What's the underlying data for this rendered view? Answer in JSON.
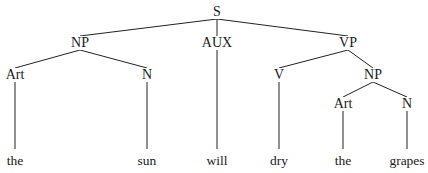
{
  "diagram": {
    "type": "syntactic-parse-tree",
    "sentence": "the sun will dry the grapes",
    "nodes": [
      {
        "id": "S",
        "label": "S",
        "x": 217,
        "y": 12
      },
      {
        "id": "NP1",
        "label": "NP",
        "x": 80,
        "y": 43
      },
      {
        "id": "AUX",
        "label": "AUX",
        "x": 217,
        "y": 43
      },
      {
        "id": "VP",
        "label": "VP",
        "x": 348,
        "y": 43
      },
      {
        "id": "ART1",
        "label": "Art",
        "x": 15,
        "y": 75
      },
      {
        "id": "N1",
        "label": "N",
        "x": 147,
        "y": 75
      },
      {
        "id": "V",
        "label": "V",
        "x": 279,
        "y": 75
      },
      {
        "id": "NP2",
        "label": "NP",
        "x": 373,
        "y": 75
      },
      {
        "id": "ART2",
        "label": "Art",
        "x": 343,
        "y": 104
      },
      {
        "id": "N2",
        "label": "N",
        "x": 407,
        "y": 104
      }
    ],
    "leaves": [
      {
        "id": "W1",
        "label": "the",
        "x": 15,
        "y": 161
      },
      {
        "id": "W2",
        "label": "sun",
        "x": 147,
        "y": 161
      },
      {
        "id": "W3",
        "label": "will",
        "x": 217,
        "y": 161
      },
      {
        "id": "W4",
        "label": "dry",
        "x": 279,
        "y": 161
      },
      {
        "id": "W5",
        "label": "the",
        "x": 343,
        "y": 161
      },
      {
        "id": "W6",
        "label": "grapes",
        "x": 407,
        "y": 161
      }
    ],
    "edges": [
      {
        "from": "S",
        "to": "NP1"
      },
      {
        "from": "S",
        "to": "AUX"
      },
      {
        "from": "S",
        "to": "VP"
      },
      {
        "from": "NP1",
        "to": "ART1"
      },
      {
        "from": "NP1",
        "to": "N1"
      },
      {
        "from": "VP",
        "to": "V"
      },
      {
        "from": "VP",
        "to": "NP2"
      },
      {
        "from": "NP2",
        "to": "ART2"
      },
      {
        "from": "NP2",
        "to": "N2"
      },
      {
        "from": "ART1",
        "to": "W1"
      },
      {
        "from": "N1",
        "to": "W2"
      },
      {
        "from": "AUX",
        "to": "W3"
      },
      {
        "from": "V",
        "to": "W4"
      },
      {
        "from": "ART2",
        "to": "W5"
      },
      {
        "from": "N2",
        "to": "W6"
      }
    ]
  }
}
